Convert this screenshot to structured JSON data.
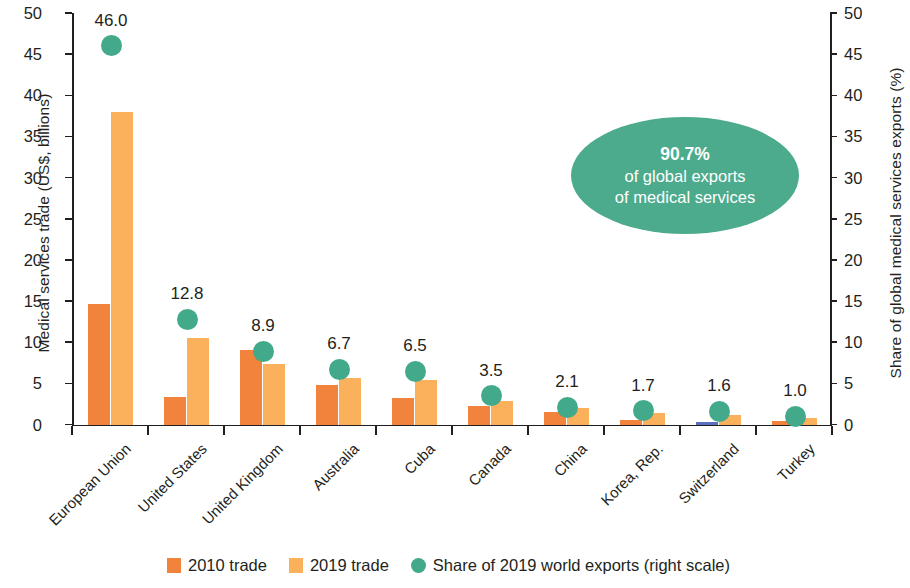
{
  "chart_data": {
    "type": "bar",
    "title": "",
    "categories": [
      "European Union",
      "United States",
      "United Kingdom",
      "Australia",
      "Cuba",
      "Canada",
      "China",
      "Korea, Rep.",
      "Switzerland",
      "Turkey"
    ],
    "series": [
      {
        "name": "2010 trade",
        "color": "#f2833c",
        "values": [
          14.7,
          3.4,
          9.0,
          4.8,
          3.2,
          2.3,
          1.5,
          0.5,
          0.35,
          0.45
        ]
      },
      {
        "name": "2019 trade",
        "color": "#fbb05c",
        "values": [
          38.0,
          10.5,
          7.4,
          5.6,
          5.4,
          2.9,
          2.0,
          1.4,
          1.2,
          0.8
        ]
      },
      {
        "name": "Share of 2019 world exports (right scale)",
        "color": "#42a98a",
        "values": [
          46.0,
          12.8,
          8.9,
          6.7,
          6.5,
          3.5,
          2.1,
          1.7,
          1.6,
          1.0
        ]
      }
    ],
    "point_labels": [
      "46.0",
      "12.8",
      "8.9",
      "6.7",
      "6.5",
      "3.5",
      "2.1",
      "1.7",
      "1.6",
      "1.0"
    ],
    "xlabel": "",
    "ylabel": "Medical services trade (US$, billions)",
    "y2label": "Share of global medical services exports (%)",
    "ylim": [
      0,
      50
    ],
    "y2lim": [
      0,
      50
    ],
    "yticks": [
      "0",
      "5",
      "10",
      "15",
      "20",
      "25",
      "30",
      "35",
      "40",
      "45",
      "50"
    ],
    "y2ticks": [
      "0",
      "5",
      "10",
      "15",
      "20",
      "25",
      "30",
      "35",
      "40",
      "45",
      "50"
    ],
    "grid": false,
    "legend_position": "bottom",
    "annotations": [
      {
        "name": "share-callout",
        "pct": "90.7%",
        "line1": "of global exports",
        "line2": "of medical services",
        "color": "#4cab8c"
      }
    ]
  },
  "legend": {
    "items": [
      {
        "label": "2010 trade",
        "marker": "square",
        "color": "#f2833c"
      },
      {
        "label": "2019 trade",
        "marker": "square",
        "color": "#fbb05c"
      },
      {
        "label": "Share of 2019 world exports (right scale)",
        "marker": "circle",
        "color": "#42a98a"
      }
    ]
  }
}
